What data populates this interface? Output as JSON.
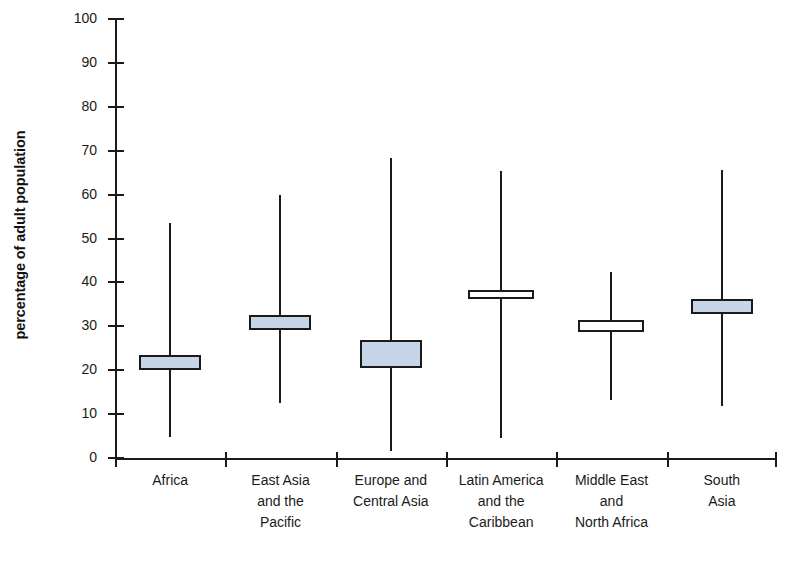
{
  "chart_data": {
    "type": "box",
    "title": "",
    "xlabel": "",
    "ylabel": "percentage of adult population",
    "ylim": [
      0,
      100
    ],
    "ytick_step": 10,
    "yticks": [
      100,
      90,
      80,
      70,
      60,
      50,
      40,
      30,
      20,
      10,
      0
    ],
    "grid": false,
    "legend": "none",
    "categories": [
      "Africa",
      "East Asia and the Pacific",
      "Europe and Central Asia",
      "Latin America and the Caribbean",
      "Middle East and North Africa",
      "South Asia"
    ],
    "category_lines": [
      [
        "Africa"
      ],
      [
        "East Asia",
        "and the",
        "Pacific"
      ],
      [
        "Europe and",
        "Central Asia"
      ],
      [
        "Latin America",
        "and the",
        "Caribbean"
      ],
      [
        "Middle East",
        "and",
        "North Africa"
      ],
      [
        "South",
        "Asia"
      ]
    ],
    "series": [
      {
        "name": "Africa",
        "whisker_high": 53.5,
        "box_high": 23.5,
        "box_low": 20.0,
        "whisker_low": 4.8,
        "fill": "filled"
      },
      {
        "name": "East Asia and the Pacific",
        "whisker_high": 59.8,
        "box_high": 32.5,
        "box_low": 29.2,
        "whisker_low": 12.5,
        "fill": "filled"
      },
      {
        "name": "Europe and Central Asia",
        "whisker_high": 68.3,
        "box_high": 26.8,
        "box_low": 20.6,
        "whisker_low": 1.5,
        "fill": "filled"
      },
      {
        "name": "Latin America and the Caribbean",
        "whisker_high": 65.4,
        "box_high": 38.3,
        "box_low": 36.2,
        "whisker_low": 4.6,
        "fill": "open"
      },
      {
        "name": "Middle East and North Africa",
        "whisker_high": 42.3,
        "box_high": 31.5,
        "box_low": 28.6,
        "whisker_low": 13.3,
        "fill": "open"
      },
      {
        "name": "South Asia",
        "whisker_high": 65.6,
        "box_high": 36.2,
        "box_low": 32.7,
        "whisker_low": 11.9,
        "fill": "filled"
      }
    ],
    "colors": {
      "box_fill": "#c7d5e8",
      "line": "#1a1a1a",
      "background": "#ffffff"
    }
  }
}
